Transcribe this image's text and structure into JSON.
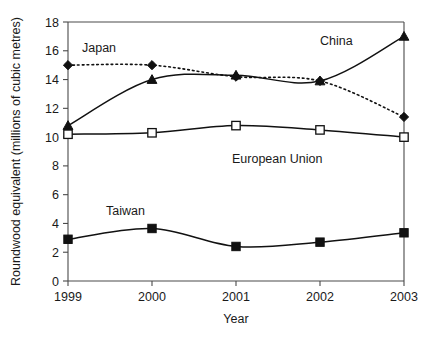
{
  "chart_data": {
    "type": "line",
    "title": "",
    "xlabel": "Year",
    "ylabel": "Roundwood equivalent (millions of cubic metres)",
    "categories": [
      "1999",
      "2000",
      "2001",
      "2002",
      "2003"
    ],
    "x": [
      1999,
      2000,
      2001,
      2002,
      2003
    ],
    "xlim": [
      1999,
      2003
    ],
    "ylim": [
      0,
      18
    ],
    "y_ticks": [
      "0",
      "2",
      "4",
      "6",
      "8",
      "10",
      "12",
      "14",
      "16",
      "18"
    ],
    "y_tick_values": [
      0,
      2,
      4,
      6,
      8,
      10,
      12,
      14,
      16,
      18
    ],
    "grid": false,
    "legend_position": "inline-annotations",
    "series": [
      {
        "name": "China",
        "values": [
          10.8,
          14.0,
          14.3,
          13.9,
          17.0
        ],
        "marker": "triangle-filled",
        "line_style": "solid",
        "color": "#111111"
      },
      {
        "name": "Japan",
        "values": [
          15.0,
          15.0,
          14.2,
          13.9,
          11.4
        ],
        "marker": "diamond-filled",
        "line_style": "dotted",
        "color": "#111111"
      },
      {
        "name": "European Union",
        "values": [
          10.2,
          10.3,
          10.8,
          10.5,
          10.0
        ],
        "marker": "square-open",
        "line_style": "solid",
        "color": "#111111"
      },
      {
        "name": "Taiwan",
        "values": [
          2.9,
          3.65,
          2.4,
          2.7,
          3.35
        ],
        "marker": "square-filled",
        "line_style": "solid",
        "color": "#111111"
      }
    ],
    "annotations": [
      {
        "text": "Japan",
        "x_px": 82,
        "y_px": 52,
        "series": "Japan"
      },
      {
        "text": "China",
        "x_px": 320,
        "y_px": 45,
        "series": "China"
      },
      {
        "text": "European Union",
        "x_px": 232,
        "y_px": 163,
        "series": "European Union"
      },
      {
        "text": "Taiwan",
        "x_px": 106,
        "y_px": 215,
        "series": "Taiwan"
      }
    ]
  },
  "axes": {
    "x_axis_title": "Year",
    "y_axis_title": "Roundwood equivalent (millions of cubic metres)",
    "x_tick_labels": [
      "1999",
      "2000",
      "2001",
      "2002",
      "2003"
    ],
    "y_tick_labels": [
      "0",
      "2",
      "4",
      "6",
      "8",
      "10",
      "12",
      "14",
      "16",
      "18"
    ]
  },
  "colors": {
    "background": "#ffffff",
    "axis": "#4a4a4a",
    "ink": "#111111",
    "text": "#1a1a1a"
  }
}
